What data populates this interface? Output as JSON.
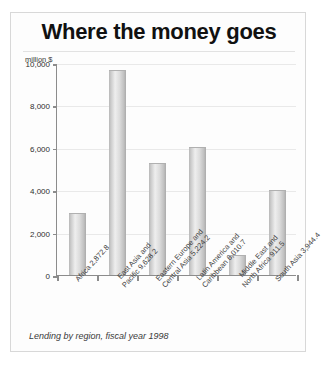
{
  "chart_data": {
    "type": "bar",
    "title": "Where the money goes",
    "caption": "Lending by region, fiscal year 1998",
    "unit_label": "million $",
    "xlabel": "",
    "ylabel": "million $",
    "ylim": [
      0,
      10000
    ],
    "grid": true,
    "legend": "none",
    "ytick_labels": [
      "10,000",
      "8,000",
      "6,000",
      "4,000",
      "2,000",
      "0"
    ],
    "ytick_values": [
      10000,
      8000,
      6000,
      4000,
      2000,
      0
    ],
    "categories": [
      "Africa",
      "East Asia and Pacific",
      "Eastern Europe and Central Asia",
      "Latin America and Caribbean",
      "Middle East and North Africa",
      "South Asia"
    ],
    "category_label_lines": [
      [
        "Africa 2,872.8"
      ],
      [
        "East Asia and",
        "Pacific 9,628.2"
      ],
      [
        "Eastern Europe and",
        "Central Asia 5,224.2"
      ],
      [
        "Latin America and",
        "Caribbean 6,010.7"
      ],
      [
        "Middle East and",
        "North Africa 911.5"
      ],
      [
        "South Asia 3,944.4"
      ]
    ],
    "values": [
      2872.8,
      9628.2,
      5224.2,
      6010.7,
      911.5,
      3944.4
    ],
    "value_labels": [
      "2,872.8",
      "9,628.2",
      "5,224.2",
      "6,010.7",
      "911.5",
      "3,944.4"
    ],
    "colors": {
      "bar_light": "#eeeeee",
      "bar_mid": "#cfcfcf",
      "bar_dark": "#ababab",
      "axis": "#8c8c8c",
      "grid": "#e9e9e9",
      "title": "#111111",
      "background": "#fdfdfd",
      "border": "#d8d8d8"
    }
  }
}
